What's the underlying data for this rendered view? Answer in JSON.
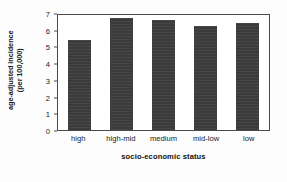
{
  "chart_data": {
    "type": "bar",
    "title": "",
    "categories": [
      "high",
      "high-mid",
      "medium",
      "mid-low",
      "low"
    ],
    "values": [
      5.4,
      6.7,
      6.6,
      6.25,
      6.4
    ],
    "xlabel": "socio-economic status",
    "ylabel_line1": "age-adjusted incidence",
    "ylabel_line2": "(per 100,000)",
    "ylabel": "age-adjusted incidence (per 100,000)",
    "ylim": [
      0,
      7
    ],
    "yticks": [
      0,
      1,
      2,
      3,
      4,
      5,
      6,
      7
    ],
    "ytick_labels": [
      "0",
      "1",
      "2",
      "3",
      "4",
      "5",
      "6",
      "7"
    ],
    "grid": false,
    "legend": null,
    "bar_color": "#3b3b3b",
    "axis_color": "#4a4a4a",
    "background": "#ffffff"
  }
}
